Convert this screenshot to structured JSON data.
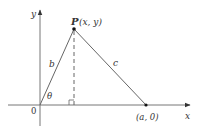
{
  "diagram": {
    "type": "geometry-triangle-on-axes",
    "colors": {
      "axis": "#555555",
      "line": "#666666",
      "point": "#111111",
      "text": "#333333",
      "background": "#ffffff"
    },
    "labels": {
      "y_axis": "y",
      "x_axis": "x",
      "origin": "0",
      "point_p_name": "P",
      "point_p_coords": "(x, y)",
      "point_a": "(a, 0)",
      "side_b": "b",
      "side_c": "c",
      "angle": "θ"
    },
    "points": {
      "origin": {
        "x": 40,
        "y": 105
      },
      "P": {
        "x": 74,
        "y": 29
      },
      "A": {
        "x": 146,
        "y": 105
      }
    },
    "segments": [
      {
        "name": "b",
        "from": "origin",
        "to": "P",
        "style": "solid"
      },
      {
        "name": "c",
        "from": "P",
        "to": "A",
        "style": "solid"
      },
      {
        "name": "altitude",
        "from": "P",
        "to": "foot",
        "style": "dashed"
      }
    ]
  }
}
